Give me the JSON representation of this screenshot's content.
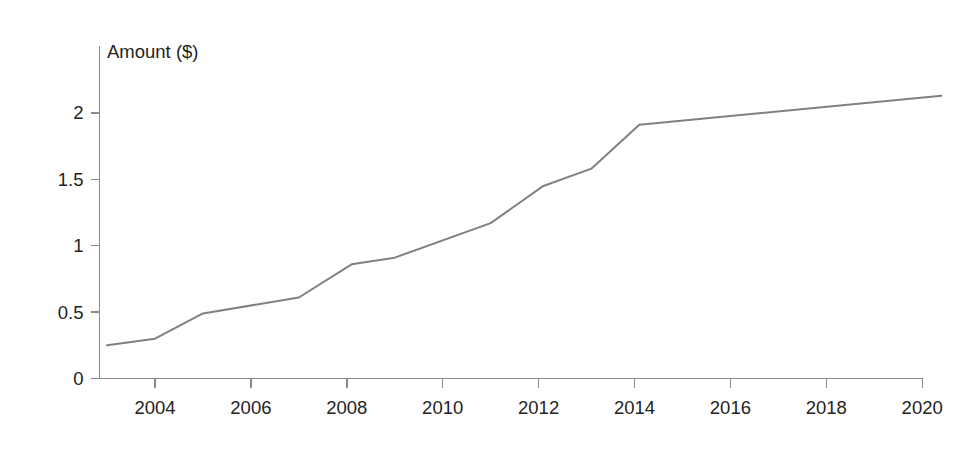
{
  "chart_data": {
    "type": "line",
    "title": "",
    "subtitle": "",
    "xlabel": "",
    "ylabel": "Amount ($)",
    "ylabel_position": "top-left-inside",
    "grid": false,
    "legend": null,
    "legend_position": "none",
    "line_color": "#808080",
    "axis_color": "#8a8a8a",
    "xlim": [
      2003,
      2020.4
    ],
    "ylim": [
      0,
      2.28
    ],
    "xticks": [
      2004,
      2006,
      2008,
      2010,
      2012,
      2014,
      2016,
      2018,
      2020
    ],
    "xtick_labels": [
      "2004",
      "2006",
      "2008",
      "2010",
      "2012",
      "2014",
      "2016",
      "2018",
      "2020"
    ],
    "yticks": [
      0,
      0.5,
      1,
      1.5,
      2
    ],
    "ytick_labels": [
      "0",
      "0.5",
      "1",
      "1.5",
      "2"
    ],
    "series": [
      {
        "name": "Amount",
        "x": [
          2003.0,
          2004.0,
          2005.0,
          2007.0,
          2008.1,
          2009.0,
          2011.0,
          2012.1,
          2013.1,
          2014.1,
          2020.4
        ],
        "values": [
          0.25,
          0.3,
          0.49,
          0.61,
          0.86,
          0.91,
          1.17,
          1.45,
          1.58,
          1.91,
          2.13
        ]
      }
    ]
  }
}
